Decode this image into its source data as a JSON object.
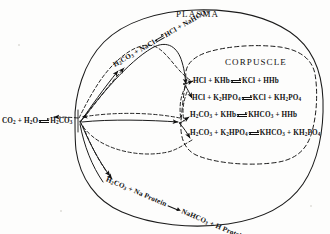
{
  "figure": {
    "background_color": "#fdfdfc",
    "ink_color": "#111111"
  },
  "regions": {
    "plasma": {
      "label": "PLASMA",
      "boundary_style": "solid"
    },
    "corpuscle": {
      "label": "CORPUSCLE",
      "boundary_style": "dashed"
    }
  },
  "equations": {
    "source": {
      "name": "carbonic-acid-formation",
      "parts": [
        "CO",
        "2",
        " + H",
        "2",
        "O",
        "H",
        "2",
        "CO",
        "3"
      ],
      "lhs_a": "CO",
      "lhs_a_sub": "2",
      "lhs_b": " + H",
      "lhs_b_sub": "2",
      "lhs_c": "O",
      "rhs_a": "H",
      "rhs_a_sub": "2",
      "rhs_b": "CO",
      "rhs_b_sub": "3",
      "arrow": "reversible"
    },
    "plasma_chloride": {
      "name": "plasma-chloride-reaction",
      "lhs_a": "H",
      "lhs_a_sub": "2",
      "lhs_b": "CO",
      "lhs_b_sub": "3",
      "lhs_c": " + NaCl",
      "rhs_a": "HCl + NaHCO",
      "rhs_a_sub": "3",
      "arrow": "reversible"
    },
    "plasma_protein": {
      "name": "plasma-protein-reaction",
      "lhs_a": "H",
      "lhs_a_sub": "2",
      "lhs_b": "CO",
      "lhs_b_sub": "3",
      "lhs_c": " + Na Protein",
      "rhs_a": "NaHCO",
      "rhs_a_sub": "3",
      "rhs_b": " + H Protein",
      "arrow": "single"
    },
    "corpuscle": [
      {
        "name": "hcl-hemoglobin",
        "lhs": [
          {
            "t": "HCl + KHb"
          }
        ],
        "rhs": [
          {
            "t": "KCl + HHb"
          }
        ],
        "arrow": "reversible"
      },
      {
        "name": "hcl-phosphate",
        "lhs": [
          {
            "t": "HCl + K"
          },
          {
            "s": "2"
          },
          {
            "t": "HPO"
          },
          {
            "s": "4"
          }
        ],
        "rhs": [
          {
            "t": "KCl + KH"
          },
          {
            "s": "2"
          },
          {
            "t": "PO"
          },
          {
            "s": "4"
          }
        ],
        "arrow": "reversible"
      },
      {
        "name": "carbonic-hemoglobin",
        "lhs": [
          {
            "t": "H"
          },
          {
            "s": "2"
          },
          {
            "t": "CO"
          },
          {
            "s": "3"
          },
          {
            "t": " + KHb"
          }
        ],
        "rhs": [
          {
            "t": "KHCO"
          },
          {
            "s": "3"
          },
          {
            "t": " + HHb"
          }
        ],
        "arrow": "reversible"
      },
      {
        "name": "carbonic-phosphate",
        "lhs": [
          {
            "t": "H"
          },
          {
            "s": "2"
          },
          {
            "t": "CO"
          },
          {
            "s": "3"
          },
          {
            "t": " + K"
          },
          {
            "s": "2"
          },
          {
            "t": "HPO"
          },
          {
            "s": "4"
          }
        ],
        "rhs": [
          {
            "t": "KHCO"
          },
          {
            "s": "3"
          },
          {
            "t": " + KH"
          },
          {
            "s": "2"
          },
          {
            "t": "PO"
          },
          {
            "s": "4"
          }
        ],
        "arrow": "reversible"
      }
    ]
  },
  "flow": {
    "solid_path_meaning": "forward reaction pathway",
    "dashed_path_meaning": "return reaction pathway"
  }
}
